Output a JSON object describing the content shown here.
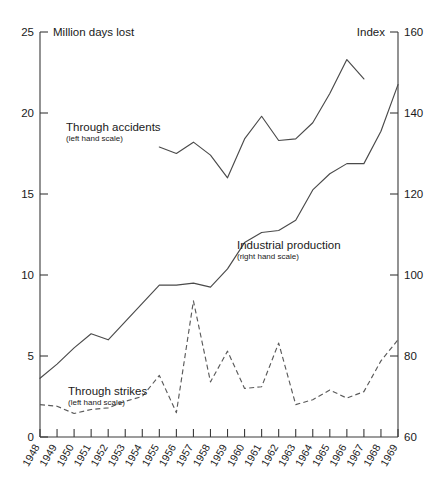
{
  "chart_data": {
    "type": "line",
    "title": "",
    "xlabel": "",
    "ylabel": "Million days lost",
    "y2label": "Index",
    "x": [
      1948,
      1949,
      1950,
      1951,
      1952,
      1953,
      1954,
      1955,
      1956,
      1957,
      1958,
      1959,
      1960,
      1961,
      1962,
      1963,
      1964,
      1965,
      1966,
      1967,
      1968,
      1969
    ],
    "xlim": [
      1948,
      1969
    ],
    "ylim": [
      0,
      25
    ],
    "y2lim": [
      60,
      160
    ],
    "yticks": [
      0,
      5,
      10,
      15,
      20,
      25
    ],
    "y2ticks": [
      60,
      80,
      100,
      120,
      140,
      160
    ],
    "xticks": [
      "1948",
      "1949",
      "1950",
      "1951",
      "1952",
      "1953",
      "1954",
      "1955",
      "1956",
      "1957",
      "1958",
      "1959",
      "1960",
      "1961",
      "1962",
      "1963",
      "1964",
      "1965",
      "1966",
      "1967",
      "1968",
      "1969"
    ],
    "grid": false,
    "legend": "inline annotations",
    "series": [
      {
        "name": "Through accidents",
        "sub": "(left hand scale)",
        "axis": "left",
        "style": "solid",
        "x": [
          1955,
          1956,
          1957,
          1958,
          1959,
          1960,
          1961,
          1962,
          1963,
          1964,
          1965,
          1966,
          1967
        ],
        "values": [
          17.9,
          17.5,
          18.2,
          17.4,
          16.0,
          18.4,
          19.8,
          18.3,
          18.4,
          19.4,
          21.2,
          23.3,
          22.1
        ]
      },
      {
        "name": "Industrial production",
        "sub": "(right hand scale)",
        "axis": "right",
        "style": "solid",
        "x": [
          1948,
          1949,
          1950,
          1951,
          1952,
          1953,
          1954,
          1955,
          1956,
          1957,
          1958,
          1959,
          1960,
          1961,
          1962,
          1963,
          1964,
          1965,
          1966,
          1967,
          1968,
          1969
        ],
        "values": [
          74.5,
          78.0,
          82.0,
          85.5,
          84.0,
          88.5,
          93.0,
          97.5,
          97.5,
          98.0,
          97.0,
          101.5,
          108.0,
          110.5,
          111.0,
          113.5,
          121.0,
          125.0,
          127.5,
          127.5,
          135.5,
          147.0
        ]
      },
      {
        "name": "Through strikes",
        "sub": "(left hand scale)",
        "axis": "left",
        "style": "dashed",
        "x": [
          1948,
          1949,
          1950,
          1951,
          1952,
          1953,
          1954,
          1955,
          1956,
          1957,
          1958,
          1959,
          1960,
          1961,
          1962,
          1963,
          1964,
          1965,
          1966,
          1967,
          1968,
          1969
        ],
        "values": [
          2.0,
          1.9,
          1.45,
          1.7,
          1.8,
          2.2,
          2.5,
          3.8,
          1.5,
          8.4,
          3.4,
          5.3,
          3.0,
          3.1,
          5.8,
          2.0,
          2.3,
          2.9,
          2.4,
          2.8,
          4.7,
          6.0
        ]
      }
    ]
  },
  "annotations": [
    {
      "label": "Through accidents",
      "sub": "(left hand scale)"
    },
    {
      "label": "Industrial production",
      "sub": "(right hand scale)"
    },
    {
      "label": "Through strikes",
      "sub": "(left hand scale)"
    }
  ],
  "axis_titles": {
    "left": "Million days lost",
    "right": "Index"
  },
  "colors": {
    "line": "#4a4a4a",
    "axis": "#3a3a3a",
    "text": "#1a1a1a",
    "background": "#ffffff"
  }
}
